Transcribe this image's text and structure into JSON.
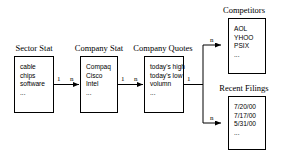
{
  "diagram": {
    "type": "entity-relationship-dataflow",
    "entities": [
      {
        "id": "sector-stat",
        "title": "Sector Stat",
        "rows": [
          "cable",
          "chips",
          "software",
          "..."
        ]
      },
      {
        "id": "company-stat",
        "title": "Company Stat",
        "rows": [
          "Compaq",
          "Cisco",
          "Intel",
          "..."
        ]
      },
      {
        "id": "company-quotes",
        "title": "Company Quotes",
        "rows": [
          "today's high",
          "today's low",
          "volumn",
          "..."
        ]
      },
      {
        "id": "competitors",
        "title": "Competitors",
        "rows": [
          "AOL",
          "YHOO",
          "PSIX",
          "..."
        ]
      },
      {
        "id": "recent-filings",
        "title": "Recent Filings",
        "rows": [
          "7/20/00",
          "7/17/00",
          "5/31/00",
          "..."
        ]
      }
    ],
    "cardinalities": {
      "sector_to_company_one": "1",
      "sector_to_company_many": "n",
      "company_to_quotes_one": "1",
      "company_to_quotes_many": "n",
      "quotes_fork_one": "1",
      "quotes_to_competitors_many": "n",
      "quotes_to_filings_many": "n"
    },
    "colors": {
      "stroke": "#000000",
      "background": "#ffffff",
      "text": "#000000"
    }
  }
}
